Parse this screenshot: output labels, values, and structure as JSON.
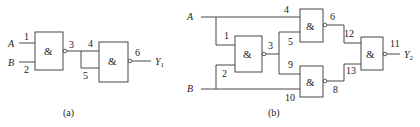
{
  "diagram_a": {
    "caption": "(a)",
    "inputs": [
      {
        "label": "A",
        "pin": "1"
      },
      {
        "label": "B",
        "pin": "2"
      }
    ],
    "gates": [
      {
        "id": "g1",
        "symbol": "&",
        "type": "NAND",
        "output_pin": "3"
      },
      {
        "id": "g2",
        "symbol": "&",
        "type": "NAND",
        "input_pins": [
          "4",
          "5"
        ],
        "output_pin": "6"
      }
    ],
    "output": {
      "label": "Y",
      "subscript": "1"
    }
  },
  "diagram_b": {
    "caption": "(b)",
    "inputs": [
      {
        "label": "A"
      },
      {
        "label": "B"
      }
    ],
    "gates": [
      {
        "id": "g3",
        "symbol": "&",
        "type": "NAND",
        "input_pins": [
          "1",
          "2"
        ],
        "output_pin": "3"
      },
      {
        "id": "g4",
        "symbol": "&",
        "type": "NAND",
        "input_pins": [
          "4",
          "5"
        ],
        "output_pin": "6"
      },
      {
        "id": "g5",
        "symbol": "&",
        "type": "NAND",
        "input_pins": [
          "9",
          "10"
        ],
        "output_pin": "8"
      },
      {
        "id": "g6",
        "symbol": "&",
        "type": "NAND",
        "input_pins": [
          "12",
          "13"
        ],
        "output_pin": "11"
      }
    ],
    "output": {
      "label": "Y",
      "subscript": "2"
    }
  }
}
